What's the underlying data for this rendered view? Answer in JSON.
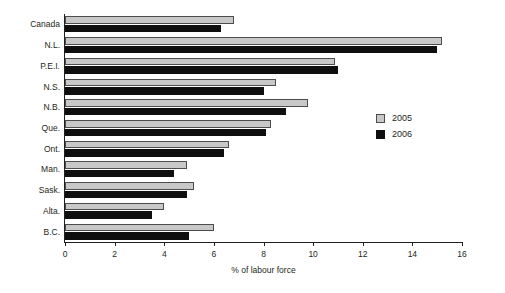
{
  "chart_data": {
    "type": "bar",
    "orientation": "horizontal",
    "title": "",
    "subtitle": "",
    "xlabel": "% of labour force",
    "ylabel": "",
    "xlim": [
      0,
      16
    ],
    "xticks": [
      0,
      2,
      4,
      6,
      8,
      10,
      12,
      14,
      16
    ],
    "xtick_labels": [
      "0",
      "2",
      "4",
      "6",
      "8",
      "10",
      "12",
      "14",
      "16"
    ],
    "grid": false,
    "legend_position": "right-middle",
    "categories": [
      "Canada",
      "N.L.",
      "P.E.I.",
      "N.S.",
      "N.B.",
      "Que.",
      "Ont.",
      "Man.",
      "Sask.",
      "Alta.",
      "B.C."
    ],
    "series": [
      {
        "name": "2005",
        "color": "#c8c8c8",
        "values": [
          6.8,
          15.2,
          10.9,
          8.5,
          9.8,
          8.3,
          6.6,
          4.9,
          5.2,
          4.0,
          6.0
        ]
      },
      {
        "name": "2006",
        "color": "#100f0f",
        "values": [
          6.3,
          15.0,
          11.0,
          8.0,
          8.9,
          8.1,
          6.4,
          4.4,
          4.9,
          3.5,
          5.0
        ]
      }
    ]
  },
  "legend": {
    "entries": [
      {
        "label": "2005"
      },
      {
        "label": "2006"
      }
    ]
  },
  "colors": {
    "series_2005": "#c8c8c8",
    "series_2006": "#100f0f",
    "axis": "#231f20",
    "background": "#ffffff"
  }
}
